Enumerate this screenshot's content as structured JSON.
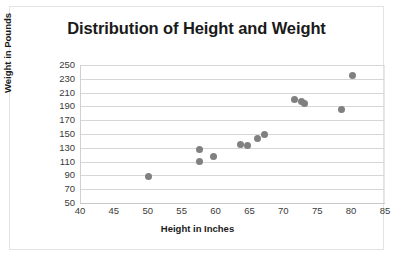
{
  "chart_data": {
    "type": "scatter",
    "title": "Distribution of Height and Weight",
    "xlabel": "Height in Inches",
    "ylabel": "Weight in Pounds",
    "xlim": [
      40,
      85
    ],
    "ylim": [
      50,
      250
    ],
    "xticks": [
      40,
      45,
      50,
      55,
      60,
      65,
      70,
      75,
      80,
      85
    ],
    "yticks": [
      50,
      70,
      90,
      110,
      130,
      150,
      170,
      190,
      210,
      230,
      250
    ],
    "grid": "horizontal",
    "legend": "none",
    "marker_color": "#808080",
    "series": [
      {
        "name": "Height vs Weight",
        "points": [
          {
            "x": 50,
            "y": 89
          },
          {
            "x": 57.5,
            "y": 127
          },
          {
            "x": 57.5,
            "y": 110
          },
          {
            "x": 59.5,
            "y": 118
          },
          {
            "x": 63.5,
            "y": 135
          },
          {
            "x": 64.5,
            "y": 133
          },
          {
            "x": 66,
            "y": 143
          },
          {
            "x": 67,
            "y": 150
          },
          {
            "x": 71.5,
            "y": 200
          },
          {
            "x": 72.5,
            "y": 197
          },
          {
            "x": 73,
            "y": 194
          },
          {
            "x": 78.5,
            "y": 186
          },
          {
            "x": 80,
            "y": 235
          }
        ]
      }
    ]
  },
  "colors": {
    "marker": "#808080",
    "gridline": "#d6d6d6",
    "border": "#e3e3e3",
    "text": "#3a3a3a",
    "title": "#1a1a1a"
  }
}
